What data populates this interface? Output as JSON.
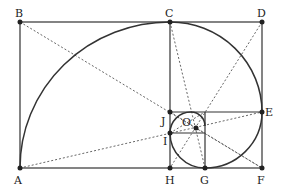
{
  "diagram": {
    "points": [
      {
        "id": "A",
        "label": "A",
        "x": 20,
        "y": 168,
        "lx": 14,
        "ly": 175
      },
      {
        "id": "B",
        "label": "B",
        "x": 20,
        "y": 22,
        "lx": 15,
        "ly": 8
      },
      {
        "id": "C",
        "label": "C",
        "x": 170,
        "y": 22,
        "lx": 165,
        "ly": 8
      },
      {
        "id": "D",
        "label": "D",
        "x": 262,
        "y": 22,
        "lx": 257,
        "ly": 8
      },
      {
        "id": "E",
        "label": "E",
        "x": 262,
        "y": 112,
        "lx": 265,
        "ly": 107
      },
      {
        "id": "F",
        "label": "F",
        "x": 262,
        "y": 168,
        "lx": 257,
        "ly": 175
      },
      {
        "id": "G",
        "label": "G",
        "x": 205,
        "y": 168,
        "lx": 200,
        "ly": 175
      },
      {
        "id": "H",
        "label": "H",
        "x": 170,
        "y": 168,
        "lx": 165,
        "ly": 175
      },
      {
        "id": "I",
        "label": "I",
        "x": 170,
        "y": 133,
        "lx": 163,
        "ly": 136
      },
      {
        "id": "J",
        "label": "J",
        "x": 170,
        "y": 112,
        "lx": 162,
        "ly": 116
      },
      {
        "id": "O",
        "label": "O",
        "x": 196,
        "y": 128,
        "lx": 182,
        "ly": 117
      }
    ],
    "colors": {
      "stroke": "#333333",
      "dotted": "#555555",
      "point": "#222222"
    }
  }
}
